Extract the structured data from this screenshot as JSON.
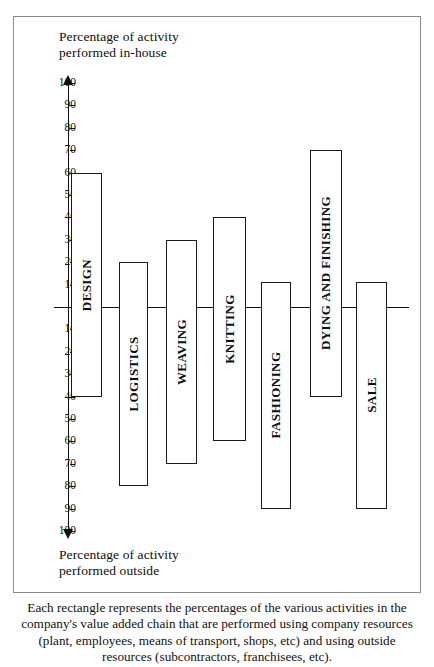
{
  "figure": {
    "top_axis_title": "Percentage of activity\nperformed in-house",
    "bottom_axis_title": "Percentage of activity\nperformed outside",
    "caption": "Each rectangle represents the percentages of the various activities in the company's value added chain that are performed using company resources (plant, employees, means of transport, shops, etc) and using outside resources (subcontractors, franchisees, etc)."
  },
  "chart_data": {
    "type": "bar",
    "xlabel": "",
    "ylabel": "Percentage of activity",
    "ylim": [
      -100,
      100
    ],
    "grid": false,
    "legend": "none",
    "orientation": "vertical-diverging",
    "zero_line": 0,
    "axis_top_label": "Percentage of activity performed in-house",
    "axis_bottom_label": "Percentage of activity performed outside",
    "tick_labels_above": [
      "100",
      "90",
      "80",
      "70",
      "60",
      "50",
      "40",
      "30",
      "20",
      "10"
    ],
    "tick_labels_below": [
      "10",
      "20",
      "30",
      "40",
      "50",
      "60",
      "70",
      "80",
      "90",
      "100"
    ],
    "categories": [
      "DESIGN",
      "LOGISTICS",
      "WEAVING",
      "KNITTING",
      "FASHIONING",
      "DYING AND FINISHING",
      "SALE"
    ],
    "series": [
      {
        "name": "Performed in-house",
        "values": [
          60,
          20,
          30,
          40,
          11,
          70,
          11
        ]
      },
      {
        "name": "Performed outside",
        "values": [
          40,
          80,
          70,
          60,
          90,
          40,
          90
        ]
      }
    ],
    "bars": [
      {
        "label": "DESIGN",
        "in_house": 60,
        "outside": 40
      },
      {
        "label": "LOGISTICS",
        "in_house": 20,
        "outside": 80
      },
      {
        "label": "WEAVING",
        "in_house": 30,
        "outside": 70
      },
      {
        "label": "KNITTING",
        "in_house": 40,
        "outside": 60
      },
      {
        "label": "FASHIONING",
        "in_house": 11,
        "outside": 90
      },
      {
        "label": "DYING AND FINISHING",
        "in_house": 70,
        "outside": 40
      },
      {
        "label": "SALE",
        "in_house": 11,
        "outside": 90
      }
    ]
  }
}
